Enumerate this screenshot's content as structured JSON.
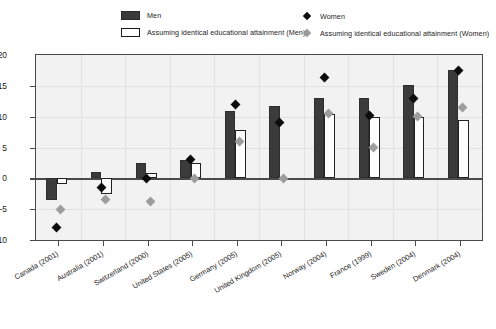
{
  "legend": {
    "items": [
      {
        "id": "men",
        "label": "Men",
        "marker": "filled-rect-dark"
      },
      {
        "id": "men_ident",
        "label": "Assuming identical educational attainment (Men)",
        "marker": "open-rect"
      },
      {
        "id": "women",
        "label": "Women",
        "marker": "filled-diamond-dark"
      },
      {
        "id": "women_ident",
        "label": "Assuming identical educational attainment (Women)",
        "marker": "filled-diamond-gray"
      }
    ]
  },
  "colors": {
    "men_bar": "#3b3b3b",
    "men_ident_bar": "#ffffff",
    "men_ident_border": "#222222",
    "women_marker": "#0d0d0d",
    "women_ident_marker": "#9d9d9d",
    "plot_background": "#f2f2f2",
    "axis": "#4a4a4a",
    "gridline": "#e0e0e0"
  },
  "chart_data": {
    "type": "bar",
    "title": "",
    "subtitle": "",
    "xlabel": "",
    "ylabel": "",
    "ylim": [
      -10,
      20
    ],
    "yticks": [
      -10,
      -5,
      0,
      5,
      10,
      15,
      20
    ],
    "ytick_labels": [
      "-10",
      "-5",
      "0",
      "5",
      "10",
      "15",
      "20"
    ],
    "grid": true,
    "legend_position": "top",
    "categories": [
      "Canada (2001)",
      "Australia (2001)",
      "Switzerland (2000)",
      "United States (2005)",
      "Germany (2005)",
      "United Kingdom (2005)",
      "Norway (2004)",
      "France (1999)",
      "Sweden (2004)",
      "Denmark (2004)"
    ],
    "series": [
      {
        "name": "Men",
        "kind": "bar",
        "values": [
          -3.5,
          1.0,
          2.5,
          3.0,
          11.0,
          11.7,
          13.0,
          13.0,
          15.2,
          17.5
        ]
      },
      {
        "name": "Assuming identical educational attainment (Men)",
        "kind": "bar",
        "values": [
          -1.0,
          -2.5,
          0.8,
          2.5,
          7.8,
          0.0,
          10.5,
          10.0,
          10.0,
          9.5
        ]
      },
      {
        "name": "Women",
        "kind": "marker",
        "values": [
          -8.0,
          -1.5,
          0.0,
          3.0,
          12.0,
          9.0,
          16.3,
          10.2,
          13.0,
          17.5
        ]
      },
      {
        "name": "Assuming identical educational attainment (Women)",
        "kind": "marker",
        "values": [
          -5.0,
          -3.5,
          -3.8,
          0.0,
          6.0,
          0.0,
          10.5,
          5.0,
          10.0,
          11.5
        ]
      }
    ]
  }
}
